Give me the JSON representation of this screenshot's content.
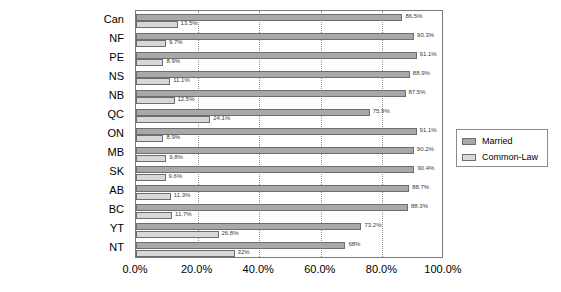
{
  "chart_data": {
    "type": "bar",
    "orientation": "horizontal",
    "title": "",
    "xlabel": "",
    "ylabel": "",
    "xlim": [
      0,
      100
    ],
    "grid": true,
    "grid_axis": "x",
    "legend_position": "right",
    "categories": [
      "Can",
      "NF",
      "PE",
      "NS",
      "NB",
      "QC",
      "ON",
      "MB",
      "SK",
      "AB",
      "BC",
      "YT",
      "NT"
    ],
    "xticks": [
      "0.0%",
      "20.0%",
      "40.0%",
      "60.0%",
      "80.0%",
      "100.0%"
    ],
    "xtick_values": [
      0,
      20,
      40,
      60,
      80,
      100
    ],
    "series": [
      {
        "name": "Married",
        "color": "#a8a8a8",
        "values": [
          86.5,
          90.3,
          91.1,
          88.9,
          87.5,
          75.9,
          91.1,
          90.2,
          90.4,
          88.7,
          88.3,
          73.2,
          68
        ],
        "labels": [
          "86.5%",
          "90.3%",
          "91.1%",
          "88.9%",
          "87.5%",
          "75.9%",
          "91.1%",
          "90.2%",
          "90.4%",
          "88.7%",
          "88.3%",
          "73.2%",
          "68%"
        ]
      },
      {
        "name": "Common-Law",
        "color": "#d8d8d8",
        "values": [
          13.5,
          9.7,
          8.9,
          11.1,
          12.5,
          24.1,
          8.9,
          9.8,
          9.6,
          11.3,
          11.7,
          26.8,
          32
        ],
        "labels": [
          "13.5%",
          "9.7%",
          "8.9%",
          "11.1%",
          "12.5%",
          "24.1%",
          "8.9%",
          "9.8%",
          "9.6%",
          "11.3%",
          "11.7%",
          "26.8%",
          "32%"
        ]
      }
    ]
  },
  "legend": {
    "items": [
      {
        "label": "Married",
        "swatch": "married"
      },
      {
        "label": "Common-Law",
        "swatch": "common"
      }
    ]
  }
}
